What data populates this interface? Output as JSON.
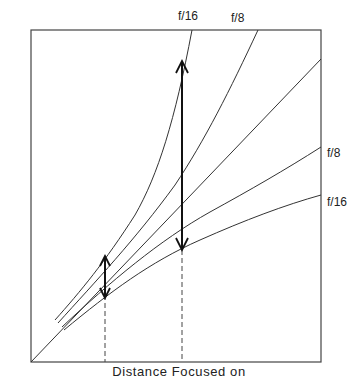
{
  "figure": {
    "xlabel": "Distance Focused on",
    "colors": {
      "line": "#333333",
      "arrow": "#111111",
      "background": "#ffffff"
    }
  },
  "labels": {
    "top_f16": "f/16",
    "top_f8": "f/8",
    "right_f8": "f/8",
    "right_f16": "f/16"
  },
  "diagram": {
    "curves": [
      {
        "name": "far-limit-f16",
        "label": "f/16",
        "position": "top"
      },
      {
        "name": "far-limit-f8",
        "label": "f/8",
        "position": "top"
      },
      {
        "name": "focused-distance-diagonal",
        "label": "",
        "position": "diagonal"
      },
      {
        "name": "near-limit-f8",
        "label": "f/8",
        "position": "right"
      },
      {
        "name": "near-limit-f16",
        "label": "f/16",
        "position": "right"
      }
    ],
    "markers": [
      {
        "name": "dof-arrow-near-distance",
        "x_px": 105
      },
      {
        "name": "dof-arrow-far-distance",
        "x_px": 182
      }
    ]
  }
}
